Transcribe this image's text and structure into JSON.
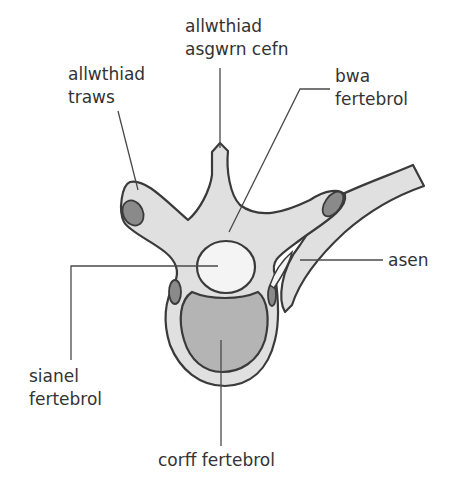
{
  "diagram": {
    "colors": {
      "background": "#ffffff",
      "bone": "#e0e0e0",
      "outline": "#3a3a3a",
      "facet": "#8a8a8a",
      "vertebral_body": "#b4b4b4",
      "canal": "#f4f4f4",
      "text": "#333333"
    },
    "labels": {
      "spinous_process": {
        "line1": "allwthiad",
        "line2": "asgwrn cefn"
      },
      "transverse_process": {
        "line1": "allwthiad",
        "line2": "traws"
      },
      "vertebral_arch": {
        "line1": "bwa",
        "line2": "fertebrol"
      },
      "rib": {
        "line1": "asen"
      },
      "vertebral_canal": {
        "line1": "sianel",
        "line2": "fertebrol"
      },
      "vertebral_body": {
        "line1": "corff fertebrol"
      }
    }
  }
}
